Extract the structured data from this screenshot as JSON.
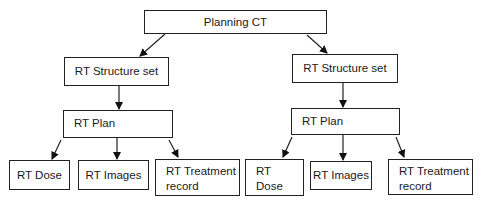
{
  "diagram": {
    "root": {
      "label": "Planning CT"
    },
    "branches": [
      {
        "structure_set": {
          "label": "RT Structure set"
        },
        "plan": {
          "label": "RT Plan"
        },
        "outputs": [
          {
            "label": "RT Dose"
          },
          {
            "label": "RT Images"
          },
          {
            "label": "RT Treatment record"
          }
        ]
      },
      {
        "structure_set": {
          "label": "RT Structure set"
        },
        "plan": {
          "label": "RT Plan"
        },
        "outputs": [
          {
            "label": "RT Dose"
          },
          {
            "label": "RT Images"
          },
          {
            "label": "RT Treatment record"
          }
        ]
      }
    ],
    "edges": [
      [
        "Planning CT",
        "RT Structure set (left)"
      ],
      [
        "Planning CT",
        "RT Structure set (right)"
      ],
      [
        "RT Structure set (left)",
        "RT Plan (left)"
      ],
      [
        "RT Structure set (right)",
        "RT Plan (right)"
      ],
      [
        "RT Plan (left)",
        "RT Dose (left)"
      ],
      [
        "RT Plan (left)",
        "RT Images (left)"
      ],
      [
        "RT Plan (left)",
        "RT Treatment record (left)"
      ],
      [
        "RT Plan (right)",
        "RT Dose (right)"
      ],
      [
        "RT Plan (right)",
        "RT Images (right)"
      ],
      [
        "RT Plan (right)",
        "RT Treatment record (right)"
      ]
    ],
    "colors": {
      "stroke": "#222222",
      "fill": "#ffffff",
      "text": "#1a1a1a"
    }
  }
}
